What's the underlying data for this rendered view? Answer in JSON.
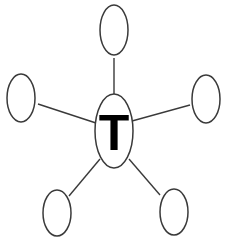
{
  "diagram": {
    "type": "hub-and-spoke",
    "center": {
      "label": "T",
      "cx": 114,
      "cy": 131,
      "rx": 19,
      "ry": 37
    },
    "satellites": [
      {
        "name": "top",
        "label": "",
        "cx": 114,
        "cy": 30,
        "rx": 14,
        "ry": 25
      },
      {
        "name": "left",
        "label": "",
        "cx": 21,
        "cy": 98,
        "rx": 14,
        "ry": 24
      },
      {
        "name": "right",
        "label": "",
        "cx": 206,
        "cy": 99,
        "rx": 14,
        "ry": 24
      },
      {
        "name": "bottom-left",
        "label": "",
        "cx": 57,
        "cy": 213,
        "rx": 14,
        "ry": 23
      },
      {
        "name": "bottom-right",
        "label": "",
        "cx": 174,
        "cy": 212,
        "rx": 14,
        "ry": 23
      }
    ],
    "edges": [
      {
        "from": "center",
        "to": "top",
        "x1": 114,
        "y1": 94,
        "x2": 114,
        "y2": 58
      },
      {
        "from": "center",
        "to": "left",
        "x1": 96,
        "y1": 123,
        "x2": 38,
        "y2": 104
      },
      {
        "from": "center",
        "to": "right",
        "x1": 132,
        "y1": 121,
        "x2": 190,
        "y2": 105
      },
      {
        "from": "center",
        "to": "bottom-left",
        "x1": 100,
        "y1": 159,
        "x2": 69,
        "y2": 196
      },
      {
        "from": "center",
        "to": "bottom-right",
        "x1": 129,
        "y1": 159,
        "x2": 160,
        "y2": 195
      }
    ],
    "colors": {
      "stroke": "#3a3a3a",
      "label": "#000000",
      "background": "#ffffff"
    }
  }
}
